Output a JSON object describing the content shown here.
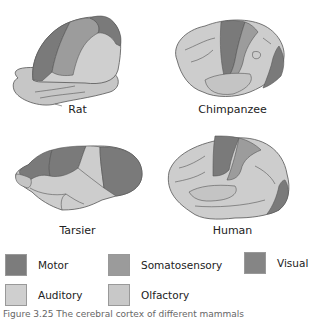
{
  "figure": {
    "panels": [
      {
        "id": "rat",
        "label": "Rat"
      },
      {
        "id": "chimpanzee",
        "label": "Chimpanzee"
      },
      {
        "id": "tarsier",
        "label": "Tarsier"
      },
      {
        "id": "human",
        "label": "Human"
      }
    ],
    "legend": [
      {
        "name": "Motor",
        "color": "#7c7c7c"
      },
      {
        "name": "Somatosensory",
        "color": "#9b9b9b"
      },
      {
        "name": "Visual",
        "color": "#858585"
      },
      {
        "name": "Auditory",
        "color": "#cfcfcf"
      },
      {
        "name": "Olfactory",
        "color": "#c8c8c8"
      }
    ],
    "caption": "Figure 3.25 The cerebral cortex of different mammals"
  },
  "colors": {
    "motor": "#7a7a7a",
    "somatosensory": "#9c9c9c",
    "visual": "#868686",
    "auditory": "#cdcdcd",
    "olfactory": "#c4c4c4",
    "outline": "#4a4a4a"
  }
}
